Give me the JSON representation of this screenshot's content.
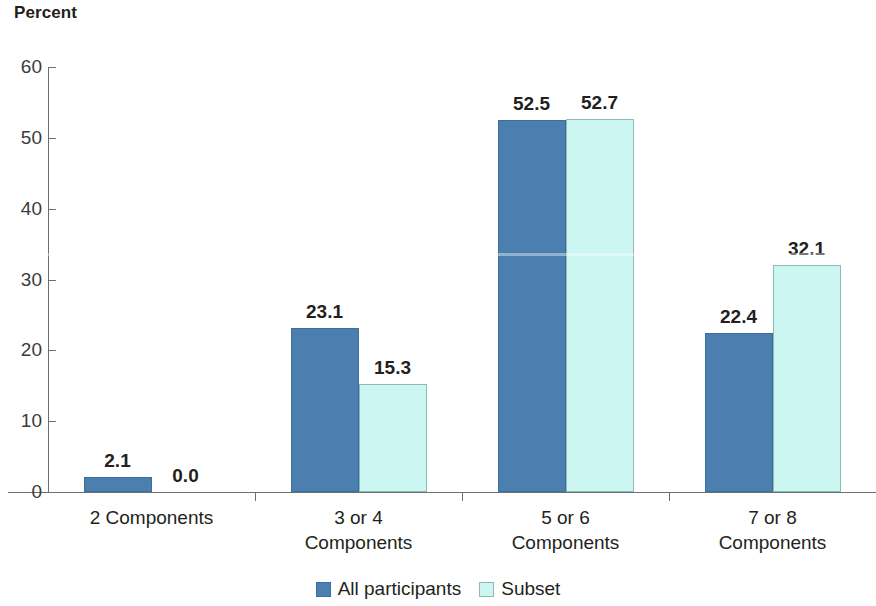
{
  "chart_data": {
    "type": "bar",
    "title": "",
    "ylabel": "Percent",
    "xlabel": "",
    "ylim": [
      0,
      60
    ],
    "yticks": [
      0,
      10,
      20,
      30,
      40,
      50,
      60
    ],
    "ytick_labels": [
      "0",
      "10",
      "20",
      "30",
      "40",
      "50",
      "60"
    ],
    "grid": false,
    "legend_position": "bottom-center",
    "categories": [
      "2 Components",
      "3 or 4\nComponents",
      "5 or 6\nComponents",
      "7 or 8\nComponents"
    ],
    "series": [
      {
        "name": "All participants",
        "color": "#4a7fb0",
        "values": [
          2.1,
          23.1,
          52.5,
          22.4
        ],
        "data_labels": [
          "2.1",
          "23.1",
          "52.5",
          "22.4"
        ]
      },
      {
        "name": "Subset",
        "color": "#ccf6f1",
        "values": [
          0.0,
          15.3,
          52.7,
          32.1
        ],
        "data_labels": [
          "0.0",
          "15.3",
          "52.7",
          "32.1"
        ]
      }
    ]
  },
  "legend": {
    "entries": [
      {
        "label": "All participants",
        "swatch_color": "#4a7fb0"
      },
      {
        "label": "Subset",
        "swatch_color": "#ccf6f1"
      }
    ]
  },
  "colors": {
    "series_all_participants": "#4a7fb0",
    "series_subset": "#ccf6f1",
    "axis": "#6d6e71",
    "text": "#231f20",
    "background": "#ffffff"
  }
}
